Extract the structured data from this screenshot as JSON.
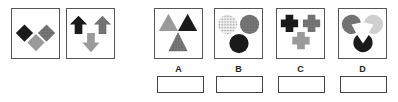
{
  "examples": [
    {
      "id": "example-1",
      "shape": "diamond",
      "items": [
        "black",
        "dotted-dark-gray",
        "light-gray"
      ]
    },
    {
      "id": "example-2",
      "shape": "arrow",
      "items": [
        "black-up",
        "dotted-dark-gray-up",
        "light-gray-down"
      ]
    }
  ],
  "options": [
    {
      "label": "A",
      "shape": "triangle",
      "items": [
        "light-gray",
        "black",
        "dotted-dark-gray"
      ]
    },
    {
      "label": "B",
      "shape": "circle",
      "items": [
        "light-dotted",
        "dark-gray",
        "black"
      ]
    },
    {
      "label": "C",
      "shape": "cross",
      "items": [
        "black",
        "dotted-dark-gray",
        "light-gray"
      ]
    },
    {
      "label": "D",
      "shape": "pacman",
      "items": [
        "gray",
        "light-gray",
        "black"
      ]
    }
  ],
  "colors": {
    "black": "#1a1a1a",
    "dark_gray": "#6e6e6e",
    "light_gray": "#9a9a9a",
    "lighter_gray": "#d0d0d0",
    "border": "#555555"
  },
  "answer_boxes": [
    "",
    "",
    "",
    ""
  ]
}
